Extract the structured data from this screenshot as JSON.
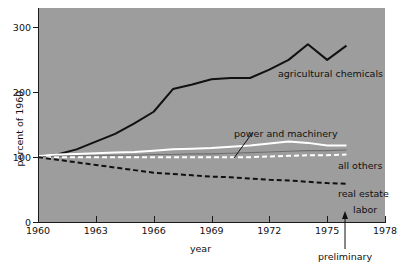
{
  "chart_data": {
    "type": "line",
    "title": "",
    "xlabel": "year",
    "ylabel": "percent of 1960",
    "xlim": [
      1960,
      1978
    ],
    "ylim": [
      0,
      330
    ],
    "grid": false,
    "legend_position": "inline-annotations",
    "x_ticks": [
      "1960",
      "1963",
      "1966",
      "1969",
      "1972",
      "1975",
      "1978"
    ],
    "x_tick_values": [
      1960,
      1963,
      1966,
      1969,
      1972,
      1975,
      1978
    ],
    "y_ticks": [
      "0",
      "100",
      "200",
      "300"
    ],
    "y_tick_values": [
      0,
      100,
      200,
      300
    ],
    "annotations": [
      {
        "text": "preliminary",
        "x_value": 1976,
        "note": "arrow pointing up to x-axis at 1976"
      }
    ],
    "x": [
      1960,
      1961,
      1962,
      1963,
      1964,
      1965,
      1966,
      1967,
      1968,
      1969,
      1970,
      1971,
      1972,
      1973,
      1974,
      1975,
      1976
    ],
    "series": [
      {
        "name": "agricultural chemicals",
        "style": "solid",
        "color": "#111111",
        "values": [
          102,
          104,
          112,
          124,
          136,
          152,
          170,
          205,
          212,
          220,
          222,
          222,
          235,
          250,
          274,
          250,
          272
        ]
      },
      {
        "name": "all others",
        "style": "solid",
        "color": "#ffffff",
        "values": [
          102,
          104,
          105,
          106,
          107,
          108,
          110,
          112,
          113,
          114,
          116,
          118,
          121,
          124,
          122,
          118,
          118
        ]
      },
      {
        "name": "power and machinery",
        "style": "solid-thin",
        "color": "#6f6f6f",
        "values": [
          101,
          101,
          102,
          102,
          103,
          103,
          104,
          104,
          105,
          105,
          106,
          107,
          108,
          109,
          110,
          110,
          111
        ]
      },
      {
        "name": "real estate",
        "style": "dashed",
        "color": "#ffffff",
        "values": [
          100,
          100,
          100,
          100,
          100,
          100,
          100,
          100,
          100,
          100,
          100,
          100,
          101,
          102,
          103,
          103,
          104
        ]
      },
      {
        "name": "labor",
        "style": "dashed",
        "color": "#111111",
        "values": [
          100,
          96,
          92,
          88,
          84,
          80,
          76,
          74,
          72,
          70,
          69,
          67,
          65,
          64,
          62,
          60,
          59
        ]
      }
    ]
  },
  "axis": {
    "y_title": "percent of 1960",
    "x_title": "year",
    "y_labels": [
      "300",
      "200",
      "100",
      "0"
    ],
    "x_labels": [
      "1960",
      "1963",
      "1966",
      "1969",
      "1972",
      "1975",
      "1978"
    ]
  },
  "labels": {
    "agricultural_chemicals": "agricultural chemicals",
    "power_and_machinery": "power and machinery",
    "all_others": "all others",
    "real_estate": "real estate",
    "labor": "labor",
    "preliminary": "preliminary"
  },
  "colors": {
    "panel": "#9d9d9d",
    "ink": "#111111",
    "white_series": "#ffffff",
    "gray_series": "#6f6f6f",
    "page": "#ffffff"
  }
}
